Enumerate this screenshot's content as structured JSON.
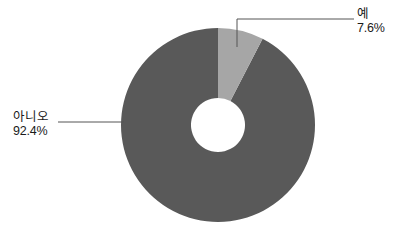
{
  "chart_data": {
    "type": "pie",
    "variant": "donut",
    "title": "",
    "subtitle": "",
    "xlabel": "",
    "ylabel": "",
    "grid": false,
    "legend_position": "none",
    "labels_position": "outside-callout",
    "start_angle_deg": 0,
    "direction": "clockwise",
    "categories": [
      "아니오",
      "예"
    ],
    "values": [
      92.4,
      7.6
    ],
    "value_unit": "%",
    "colors": [
      "#595959",
      "#a6a6a6"
    ],
    "slices": [
      {
        "label": "아니오",
        "value_text": "92.4%",
        "value": 92.4,
        "color": "#595959",
        "sweep_deg": 332.6
      },
      {
        "label": "예",
        "value_text": "7.6%",
        "value": 7.6,
        "color": "#a6a6a6",
        "sweep_deg": 27.4
      }
    ]
  },
  "geometry": {
    "center_x": 218,
    "center_y": 125,
    "outer_radius": 97,
    "inner_radius": 27
  },
  "callouts": {
    "no": {
      "category": "아니오",
      "percent": "92.4%"
    },
    "yes": {
      "category": "예",
      "percent": "7.6%"
    }
  },
  "style": {
    "background": "#ffffff",
    "leader_color": "#555555",
    "text_color": "#1a1a1a"
  }
}
